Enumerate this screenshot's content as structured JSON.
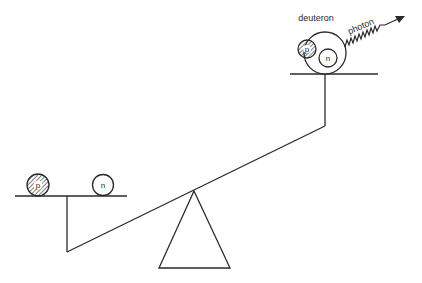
{
  "diagram": {
    "type": "seesaw-binding-energy",
    "labels": {
      "deuteron": "deuteron",
      "photon": "photon",
      "proton_left": "p",
      "neutron_left": "n",
      "proton_deuteron": "p",
      "neutron_deuteron": "n"
    },
    "left_pan": {
      "contents": [
        "proton (p)",
        "neutron (n)"
      ],
      "position": "low"
    },
    "right_pan": {
      "contents": [
        "deuteron (p + n bound)"
      ],
      "position": "high",
      "emits": "photon"
    },
    "colors": {
      "ink": "#2a2a2a",
      "background": "#ffffff"
    }
  }
}
